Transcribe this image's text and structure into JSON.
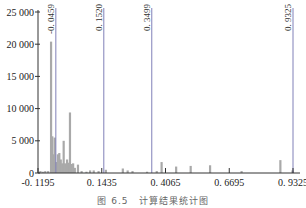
{
  "chart_data": {
    "type": "bar",
    "title": "",
    "caption": "图 6.5　计算结果统计图",
    "xlabel": "",
    "ylabel": "",
    "xlim": [
      -0.1195,
      0.9325
    ],
    "ylim": [
      0,
      25000
    ],
    "xticks": [
      "-0. 1195",
      "0. 1435",
      "0. 4065",
      "0. 6695",
      "0. 9325"
    ],
    "xtick_values": [
      -0.1195,
      0.1435,
      0.4065,
      0.6695,
      0.9325
    ],
    "yticks": [
      "0",
      "5 000",
      "10 000",
      "15 000",
      "20 000",
      "25 000"
    ],
    "ytick_values": [
      0,
      5000,
      10000,
      15000,
      20000,
      25000
    ],
    "grid": false,
    "legend": null,
    "reference_lines": [
      {
        "x": -0.0459,
        "label": "-0. 0459"
      },
      {
        "x": 0.152,
        "label": "0. 1520"
      },
      {
        "x": 0.3499,
        "label": "0. 3499"
      },
      {
        "x": 0.9325,
        "label": "0. 9325"
      }
    ],
    "bars": [
      {
        "x": -0.11,
        "value": 300
      },
      {
        "x": -0.1,
        "value": 200
      },
      {
        "x": -0.09,
        "value": 300
      },
      {
        "x": -0.078,
        "value": 300
      },
      {
        "x": -0.066,
        "value": 20400
      },
      {
        "x": -0.061,
        "value": 5700
      },
      {
        "x": -0.056,
        "value": 2900
      },
      {
        "x": -0.051,
        "value": 5500
      },
      {
        "x": -0.046,
        "value": 1700
      },
      {
        "x": -0.038,
        "value": 2900
      },
      {
        "x": -0.032,
        "value": 3100
      },
      {
        "x": -0.026,
        "value": 2100
      },
      {
        "x": -0.02,
        "value": 1500
      },
      {
        "x": -0.014,
        "value": 5000
      },
      {
        "x": -0.008,
        "value": 1500
      },
      {
        "x": 0.0,
        "value": 2100
      },
      {
        "x": 0.006,
        "value": 1600
      },
      {
        "x": 0.012,
        "value": 9400
      },
      {
        "x": 0.018,
        "value": 1400
      },
      {
        "x": 0.025,
        "value": 1500
      },
      {
        "x": 0.032,
        "value": 800
      },
      {
        "x": 0.045,
        "value": 1300
      },
      {
        "x": 0.06,
        "value": 300
      },
      {
        "x": 0.08,
        "value": 200
      },
      {
        "x": 0.095,
        "value": 400
      },
      {
        "x": 0.11,
        "value": 400
      },
      {
        "x": 0.13,
        "value": 300
      },
      {
        "x": 0.16,
        "value": 500
      },
      {
        "x": 0.23,
        "value": 700
      },
      {
        "x": 0.25,
        "value": 400
      },
      {
        "x": 0.27,
        "value": 300
      },
      {
        "x": 0.33,
        "value": 200
      },
      {
        "x": 0.37,
        "value": 300
      },
      {
        "x": 0.39,
        "value": 1700
      },
      {
        "x": 0.45,
        "value": 1000
      },
      {
        "x": 0.51,
        "value": 1100
      },
      {
        "x": 0.59,
        "value": 1200
      },
      {
        "x": 0.72,
        "value": 300
      },
      {
        "x": 0.88,
        "value": 2000
      },
      {
        "x": 0.93,
        "value": 400
      }
    ]
  }
}
